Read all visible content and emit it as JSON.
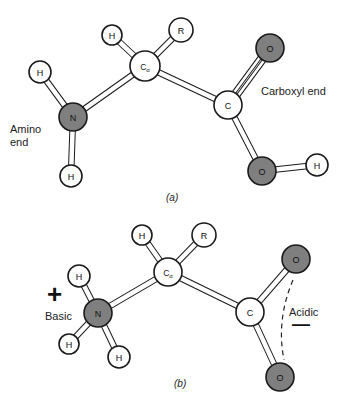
{
  "figure": {
    "colors": {
      "bond_outline": "#1a1a1a",
      "bond_fill": "#ffffff",
      "atom_light": "#ffffff",
      "atom_dark": "#7f7f7f",
      "atom_outline": "#1a1a1a",
      "dash": "#222222"
    },
    "panel_a": {
      "caption": "(a)",
      "labels": {
        "amino_line1": "Amino",
        "amino_line2": "end",
        "carboxyl": "Carboxyl end"
      },
      "atoms": [
        {
          "id": "H1",
          "label": "H",
          "x": 40,
          "y": 72,
          "r": 11,
          "dark": false
        },
        {
          "id": "N",
          "label": "N",
          "x": 73,
          "y": 117,
          "r": 14,
          "dark": true
        },
        {
          "id": "H2",
          "label": "H",
          "x": 71,
          "y": 176,
          "r": 11,
          "dark": false
        },
        {
          "id": "Ca",
          "label": "Cα",
          "x": 145,
          "y": 66,
          "r": 15,
          "dark": false
        },
        {
          "id": "H3",
          "label": "H",
          "x": 112,
          "y": 35,
          "r": 10,
          "dark": false
        },
        {
          "id": "R",
          "label": "R",
          "x": 181,
          "y": 30,
          "r": 12,
          "dark": false
        },
        {
          "id": "C",
          "label": "C",
          "x": 228,
          "y": 105,
          "r": 14,
          "dark": false
        },
        {
          "id": "O1",
          "label": "O",
          "x": 270,
          "y": 48,
          "r": 14,
          "dark": true
        },
        {
          "id": "O2",
          "label": "O",
          "x": 262,
          "y": 171,
          "r": 14,
          "dark": true
        },
        {
          "id": "H4",
          "label": "H",
          "x": 317,
          "y": 165,
          "r": 11,
          "dark": false
        }
      ],
      "bonds": [
        [
          "H1",
          "N",
          1
        ],
        [
          "N",
          "H2",
          1
        ],
        [
          "N",
          "Ca",
          1
        ],
        [
          "Ca",
          "H3",
          1
        ],
        [
          "Ca",
          "R",
          1
        ],
        [
          "Ca",
          "C",
          1
        ],
        [
          "C",
          "O1",
          2
        ],
        [
          "C",
          "O2",
          1
        ],
        [
          "O2",
          "H4",
          1
        ]
      ]
    },
    "panel_b": {
      "caption": "(b)",
      "labels": {
        "basic": "Basic",
        "plus": "+",
        "acidic": "Acidic",
        "minus": "—"
      },
      "atoms": [
        {
          "id": "H1",
          "label": "H",
          "x": 79,
          "y": 276,
          "r": 11,
          "dark": false
        },
        {
          "id": "N",
          "label": "N",
          "x": 98,
          "y": 313,
          "r": 14,
          "dark": true
        },
        {
          "id": "H2",
          "label": "H",
          "x": 69,
          "y": 344,
          "r": 10,
          "dark": false
        },
        {
          "id": "H3",
          "label": "H",
          "x": 119,
          "y": 357,
          "r": 11,
          "dark": false
        },
        {
          "id": "Ca",
          "label": "Cα",
          "x": 168,
          "y": 272,
          "r": 14,
          "dark": false
        },
        {
          "id": "H4",
          "label": "H",
          "x": 142,
          "y": 235,
          "r": 10,
          "dark": false
        },
        {
          "id": "R",
          "label": "R",
          "x": 204,
          "y": 235,
          "r": 12,
          "dark": false
        },
        {
          "id": "C",
          "label": "C",
          "x": 250,
          "y": 312,
          "r": 14,
          "dark": false
        },
        {
          "id": "O1",
          "label": "O",
          "x": 296,
          "y": 259,
          "r": 14,
          "dark": true
        },
        {
          "id": "O2",
          "label": "O",
          "x": 280,
          "y": 377,
          "r": 14,
          "dark": true
        }
      ],
      "bonds": [
        [
          "H1",
          "N",
          1
        ],
        [
          "N",
          "H2",
          1
        ],
        [
          "N",
          "H3",
          1
        ],
        [
          "N",
          "Ca",
          1
        ],
        [
          "Ca",
          "H4",
          1
        ],
        [
          "Ca",
          "R",
          1
        ],
        [
          "Ca",
          "C",
          1
        ],
        [
          "C",
          "O1",
          1
        ],
        [
          "C",
          "O2",
          1
        ]
      ]
    }
  }
}
